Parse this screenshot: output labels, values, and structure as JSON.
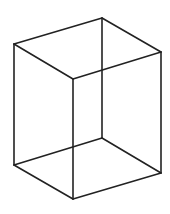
{
  "figure": {
    "type": "wireframe-cube",
    "stroke_color": "#222222",
    "background": "#ffffff",
    "vertices": {
      "top_back": [
        102,
        18
      ],
      "top_left": [
        14,
        44
      ],
      "top_right": [
        161,
        52
      ],
      "top_front": [
        73,
        79
      ],
      "bottom_back": [
        102,
        138
      ],
      "bottom_left": [
        14,
        165
      ],
      "bottom_right": [
        161,
        173
      ],
      "bottom_front": [
        73,
        199
      ]
    }
  }
}
